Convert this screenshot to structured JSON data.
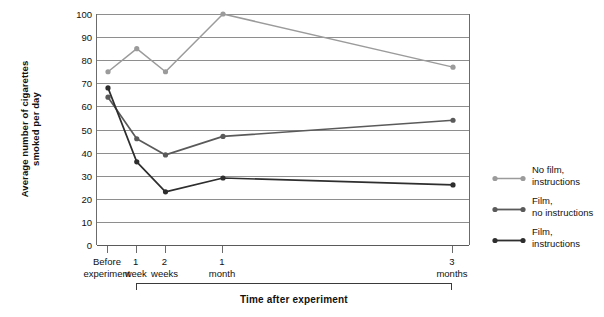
{
  "chart_data": {
    "type": "line",
    "title": "",
    "xlabel": "Time after experiment",
    "ylabel": "Average number of cigarettes\nsmoked per day",
    "categories": [
      "Before\nexperiment",
      "1\nweek",
      "2\nweeks",
      "1\nmonth",
      "3\nmonths"
    ],
    "x_positions": [
      0,
      1,
      2,
      4,
      12
    ],
    "ylim": [
      0,
      100
    ],
    "y_ticks": [
      0,
      10,
      20,
      30,
      40,
      50,
      60,
      70,
      80,
      90,
      100
    ],
    "grid": true,
    "legend_position": "right",
    "series": [
      {
        "name": "No film,\ninstructions",
        "color": "#9b9b9b",
        "values": [
          75,
          85,
          75,
          100,
          77
        ]
      },
      {
        "name": "Film,\nno instructions",
        "color": "#5a5a5a",
        "values": [
          64,
          46,
          39,
          47,
          54
        ]
      },
      {
        "name": "Film,\ninstructions",
        "color": "#2e2e2e",
        "values": [
          68,
          36,
          23,
          29,
          26
        ]
      }
    ]
  },
  "axis": {
    "y_title": "Average number of cigarettes\nsmoked per day",
    "x_title": "Time after experiment"
  },
  "legend": {
    "entries": [
      {
        "label": "No film,\ninstructions",
        "color": "#9b9b9b"
      },
      {
        "label": "Film,\nno instructions",
        "color": "#5a5a5a"
      },
      {
        "label": "Film,\ninstructions",
        "color": "#2e2e2e"
      }
    ]
  }
}
